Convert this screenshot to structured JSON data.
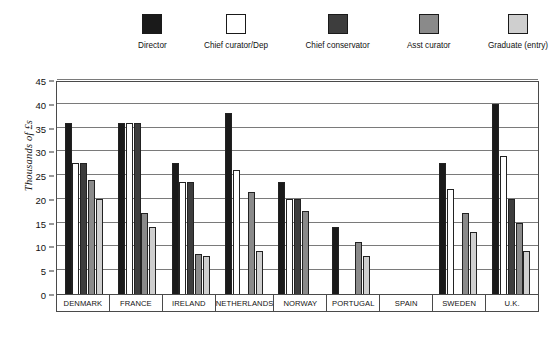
{
  "chart_data": {
    "type": "bar",
    "title": "",
    "subtitle": "",
    "xlabel": "",
    "ylabel": "Thousands of £s",
    "ylim": [
      0,
      45
    ],
    "yticks": [
      0,
      5,
      10,
      15,
      20,
      25,
      30,
      35,
      40,
      45
    ],
    "grid": true,
    "legend_position": "top",
    "categories": [
      "DENMARK",
      "FRANCE",
      "IRELAND",
      "NETHERLANDS",
      "NORWAY",
      "PORTUGAL",
      "SPAIN",
      "SWEDEN",
      "U.K."
    ],
    "series": [
      {
        "name": "Director",
        "color": "#1a1a1a",
        "values": [
          36,
          36,
          27.5,
          38,
          23.5,
          14,
          0,
          27.5,
          40
        ]
      },
      {
        "name": "Chief curator/Dep",
        "color": "#ffffff",
        "values": [
          27.5,
          36,
          23.5,
          26,
          20,
          0,
          0,
          22,
          29
        ]
      },
      {
        "name": "Chief conservator",
        "color": "#3d3d3d",
        "values": [
          27.5,
          36,
          23.5,
          0,
          20,
          0,
          0,
          0,
          20
        ]
      },
      {
        "name": "Asst curator",
        "color": "#8a8a8a",
        "values": [
          24,
          17,
          8.5,
          21.5,
          17.5,
          11,
          0,
          17,
          15
        ]
      },
      {
        "name": "Graduate (entry)",
        "color": "#cfcfcf",
        "values": [
          20,
          14,
          8,
          9,
          0,
          8,
          0,
          13,
          9
        ]
      }
    ]
  },
  "legend": {
    "entries": [
      {
        "label": "Director",
        "color": "#1a1a1a"
      },
      {
        "label": "Chief curator/Dep",
        "color": "#ffffff"
      },
      {
        "label": "Chief conservator",
        "color": "#3d3d3d"
      },
      {
        "label": "Asst curator",
        "color": "#8a8a8a"
      },
      {
        "label": "Graduate (entry)",
        "color": "#cfcfcf"
      }
    ]
  },
  "caption": ""
}
